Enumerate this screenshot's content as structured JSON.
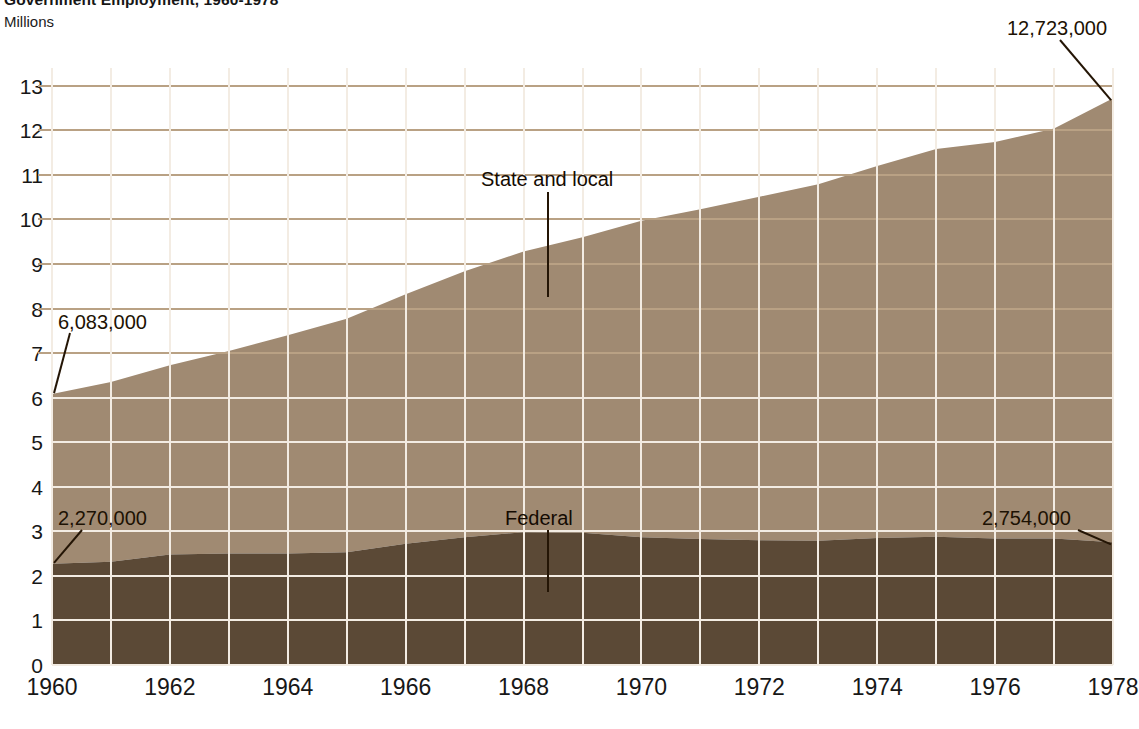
{
  "title": "Government Employment, 1960-1978",
  "y_axis_caption": "Millions",
  "colors": {
    "state_local": "#a08a72",
    "federal": "#5b4936",
    "grid_above": "#b9a184",
    "grid_inside": "#f3ece3",
    "background": "#ffffff",
    "text": "#171717"
  },
  "annotations": {
    "start_total": "6,083,000",
    "end_total": "12,723,000",
    "start_federal": "2,270,000",
    "end_federal": "2,754,000",
    "series_upper": "State and local",
    "series_lower": "Federal"
  },
  "chart_data": {
    "type": "area",
    "stacked": true,
    "title": "Government Employment, 1960-1978",
    "xlabel": "",
    "ylabel": "Millions",
    "xlim": [
      1960,
      1978
    ],
    "ylim": [
      0,
      13.4
    ],
    "grid": true,
    "legend": "inline-annotations",
    "y_ticks": [
      "0",
      "1",
      "2",
      "3",
      "4",
      "5",
      "6",
      "7",
      "8",
      "9",
      "10",
      "11",
      "12",
      "13"
    ],
    "y_tick_values": [
      0,
      1,
      2,
      3,
      4,
      5,
      6,
      7,
      8,
      9,
      10,
      11,
      12,
      13
    ],
    "x_ticks": [
      "1960",
      "1962",
      "1964",
      "1966",
      "1968",
      "1970",
      "1972",
      "1974",
      "1976",
      "1978"
    ],
    "x_tick_values": [
      1960,
      1962,
      1964,
      1966,
      1968,
      1970,
      1972,
      1974,
      1976,
      1978
    ],
    "x": [
      1960,
      1961,
      1962,
      1963,
      1964,
      1965,
      1966,
      1967,
      1968,
      1969,
      1970,
      1971,
      1972,
      1973,
      1974,
      1975,
      1976,
      1977,
      1978
    ],
    "series": [
      {
        "name": "Federal",
        "color": "#5b4936",
        "values": [
          2.27,
          2.32,
          2.48,
          2.5,
          2.5,
          2.53,
          2.72,
          2.87,
          2.98,
          2.97,
          2.87,
          2.83,
          2.8,
          2.79,
          2.85,
          2.88,
          2.84,
          2.84,
          2.754
        ]
      },
      {
        "name": "State and local",
        "color": "#a08a72",
        "values": [
          3.81,
          4.03,
          4.25,
          4.55,
          4.9,
          5.24,
          5.6,
          5.97,
          6.3,
          6.63,
          7.1,
          7.4,
          7.71,
          8.0,
          8.35,
          8.7,
          8.9,
          9.2,
          9.969
        ]
      }
    ],
    "totals": [
      6.083,
      6.35,
      6.73,
      7.05,
      7.4,
      7.77,
      8.32,
      8.84,
      9.28,
      9.6,
      9.97,
      10.23,
      10.51,
      10.79,
      11.2,
      11.58,
      11.74,
      12.04,
      12.723
    ],
    "data_labels": [
      {
        "text": "6,083,000",
        "x": 1960,
        "y": 6.083,
        "series": "total"
      },
      {
        "text": "12,723,000",
        "x": 1978,
        "y": 12.723,
        "series": "total"
      },
      {
        "text": "2,270,000",
        "x": 1960,
        "y": 2.27,
        "series": "Federal"
      },
      {
        "text": "2,754,000",
        "x": 1978,
        "y": 2.754,
        "series": "Federal"
      }
    ]
  }
}
